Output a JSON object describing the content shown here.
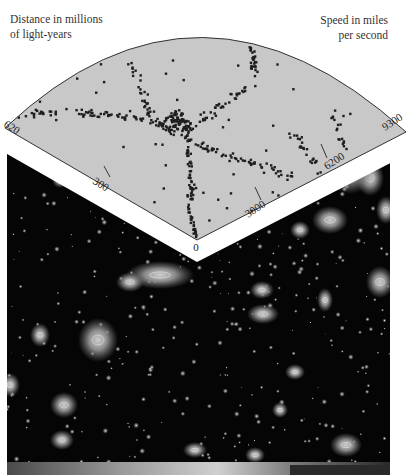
{
  "page": {
    "running_header": "GREAT BUBBLES 55"
  },
  "figure": {
    "left_axis_caption_line1": "Distance in millions",
    "left_axis_caption_line2": "of light-years",
    "right_axis_caption_line1": "Speed in miles",
    "right_axis_caption_line2": "per second",
    "distance_ticks": [
      "620",
      "300",
      "0"
    ],
    "speed_ticks": [
      "3000",
      "6200",
      "9300"
    ],
    "apex_label": "0",
    "colors": {
      "wedge_fill": "#c8c8c8",
      "wedge_outline": "#333333",
      "galaxy_dot": "#1e1e1e",
      "sim_background": "#050505",
      "sim_cluster": "#8a8a8a",
      "sim_core": "#d8d8d8"
    }
  }
}
